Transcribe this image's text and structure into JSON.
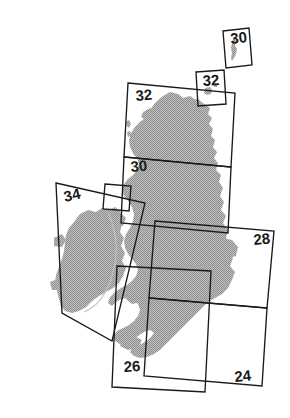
{
  "figure": {
    "type": "map-index-diagram",
    "width": 290,
    "height": 418,
    "background_color": "#ffffff"
  },
  "colors": {
    "land_fill": "#b4b4b4",
    "land_stipple": "#999999",
    "outline": "#1a1a1a",
    "label_text": "#1a1a1a",
    "internal_border": "#c8c8c8",
    "background": "#ffffff"
  },
  "landmasses": [
    {
      "name": "shetland",
      "label": "Shetland Islands"
    },
    {
      "name": "orkney",
      "label": "Orkney Islands"
    },
    {
      "name": "great-britain",
      "label": "Great Britain"
    },
    {
      "name": "ireland",
      "label": "Ireland"
    }
  ],
  "sheets": [
    {
      "id": "sheet-30-shetland",
      "label": "30",
      "label_x": 231,
      "label_y": 44,
      "rotation": -7,
      "points": "223,31 249,28 252,65 226,68"
    },
    {
      "id": "sheet-32-orkney",
      "label": "32",
      "label_x": 203,
      "label_y": 86,
      "rotation": -4,
      "points": "196,72 224,70 226,104 198,106"
    },
    {
      "id": "sheet-32-north-scotland",
      "label": "32",
      "label_x": 136,
      "label_y": 101,
      "rotation": -5,
      "points": "128,83 235,93 231,167 124,157"
    },
    {
      "id": "sheet-30-central-scotland",
      "label": "30",
      "label_x": 131,
      "label_y": 172,
      "rotation": -5,
      "points": "124,157 231,167 228,233 121,223"
    },
    {
      "id": "sheet-30-inset",
      "label": "",
      "label_x": 0,
      "label_y": 0,
      "rotation": -5,
      "points": "105,184 131,186 129,211 103,209"
    },
    {
      "id": "sheet-34-ireland",
      "label": "34",
      "label_x": 65,
      "label_y": 202,
      "rotation": -13,
      "points": "56,183 145,203 112,341 62,313"
    },
    {
      "id": "sheet-28-england-north",
      "label": "28",
      "label_x": 254,
      "label_y": 245,
      "rotation": -6,
      "points": "155,221 274,231 267,308 149,298"
    },
    {
      "id": "sheet-24-england-south",
      "label": "24",
      "label_x": 235,
      "label_y": 382,
      "rotation": -6,
      "points": "149,298 267,308 262,386 144,376"
    },
    {
      "id": "sheet-26-wales-southwest",
      "label": "26",
      "label_x": 124,
      "label_y": 372,
      "rotation": -3,
      "points": "117,266 211,271 205,392 112,387"
    }
  ],
  "legend": {
    "sheet_numbers": [
      "24",
      "26",
      "28",
      "30",
      "30",
      "32",
      "32",
      "34"
    ]
  }
}
